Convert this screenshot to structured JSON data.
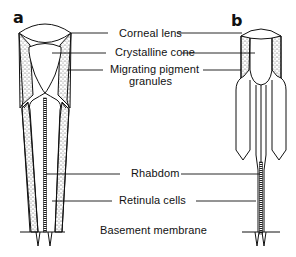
{
  "figure": {
    "panels": [
      {
        "letter": "a"
      },
      {
        "letter": "b"
      }
    ],
    "labels": [
      {
        "text": "Corneal lens"
      },
      {
        "text": "Crystalline cone"
      },
      {
        "text": "Migrating pigment"
      },
      {
        "text": "granules"
      },
      {
        "text": "Rhabdom"
      },
      {
        "text": "Retinula cells"
      },
      {
        "text": "Basement membrane"
      }
    ]
  }
}
